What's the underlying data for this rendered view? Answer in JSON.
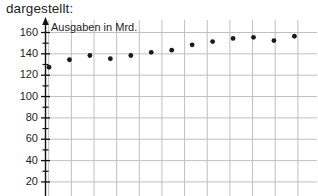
{
  "intro": {
    "text": "dargestellt:"
  },
  "colors": {
    "text": "#1d1d1d",
    "axis": "#111111",
    "grid": "#b9b9b9",
    "grid_minor": "#d8d8d8",
    "point": "#1a1a1a",
    "background": "#ffffff"
  },
  "chart_data": {
    "type": "scatter",
    "title": "",
    "subtitle": "",
    "xlabel": "",
    "ylabel": "Ausgaben in Mrd.",
    "ylim": [
      20,
      160
    ],
    "ytick_labels": [
      "160",
      "140",
      "120",
      "100",
      "80",
      "60",
      "40",
      "20"
    ],
    "ytick_values": [
      160,
      140,
      120,
      100,
      80,
      60,
      40,
      20
    ],
    "ytick_step": 20,
    "yminor_step": 10,
    "grid": true,
    "legend": "none",
    "x": [
      1,
      2,
      3,
      4,
      5,
      6,
      7,
      8,
      9,
      10,
      11,
      12,
      13
    ],
    "values": [
      127,
      134,
      138,
      135,
      138,
      141,
      143,
      148,
      151,
      154,
      155,
      152,
      156
    ],
    "annotations": []
  },
  "axis": {
    "arrow": "up-arrow-icon"
  }
}
